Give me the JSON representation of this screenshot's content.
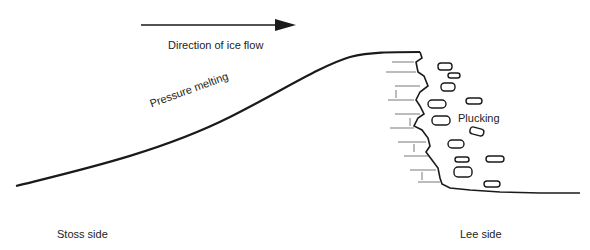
{
  "diagram": {
    "type": "roche moutonnée cross-section",
    "labels": {
      "flow": "Direction of ice flow",
      "pressure": "Pressure melting",
      "plucking": "Plucking",
      "stoss": "Stoss side",
      "lee": "Lee side"
    },
    "colors": {
      "line": "#1a1a1a",
      "text": "#222222",
      "background": "#ffffff"
    }
  }
}
